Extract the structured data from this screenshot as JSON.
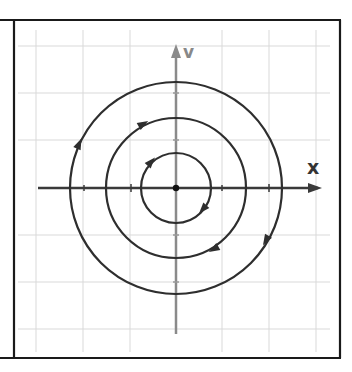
{
  "figure": {
    "axes": {
      "x_label": "x",
      "y_label": "v"
    },
    "colors": {
      "frame": "#1a1a1a",
      "grid": "#d4d4d4",
      "x_axis": "#3a3a3a",
      "y_axis": "#8a8a8a",
      "orbit": "#2e2e2e",
      "x_label": "#333333",
      "y_label": "#888888"
    },
    "orbits": [
      {
        "name": "inner",
        "radius_units": 0.75,
        "direction": "clockwise"
      },
      {
        "name": "middle",
        "radius_units": 1.5,
        "direction": "clockwise"
      },
      {
        "name": "outer",
        "radius_units": 2.25,
        "direction": "clockwise"
      }
    ],
    "equilibrium": {
      "label": "origin",
      "x": 0,
      "v": 0
    }
  }
}
